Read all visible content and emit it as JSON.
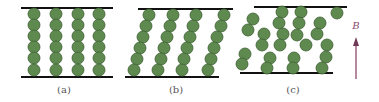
{
  "figure": {
    "panels": [
      {
        "id": "a",
        "label": "(a)",
        "description": "chains aligned vertically"
      },
      {
        "id": "b",
        "label": "(b)",
        "description": "chains tilted"
      },
      {
        "id": "c",
        "label": "(c)",
        "description": "chains broken / disordered"
      }
    ],
    "field": {
      "label": "B",
      "color": "#8b4a6e"
    },
    "colors": {
      "particle": "#5f8a4f",
      "particle_outline": "#3e5f34",
      "plate": "#111111",
      "label": "#555555"
    }
  }
}
